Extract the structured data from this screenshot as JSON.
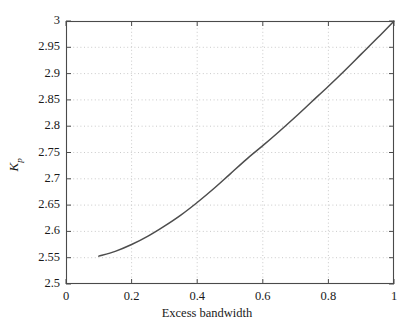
{
  "chart_data": {
    "type": "line",
    "title": "",
    "xlabel": "Excess bandwidth",
    "ylabel": "K_p",
    "ylabel_base": "K",
    "ylabel_sub": "p",
    "xlim": [
      0,
      1
    ],
    "ylim": [
      2.5,
      3
    ],
    "xticks": [
      "0",
      "0.2",
      "0.4",
      "0.6",
      "0.8",
      "1"
    ],
    "xtick_values": [
      0,
      0.2,
      0.4,
      0.6,
      0.8,
      1
    ],
    "yticks": [
      "2.5",
      "2.55",
      "2.6",
      "2.65",
      "2.7",
      "2.75",
      "2.8",
      "2.85",
      "2.9",
      "2.95",
      "3"
    ],
    "ytick_values": [
      2.5,
      2.55,
      2.6,
      2.65,
      2.7,
      2.75,
      2.8,
      2.85,
      2.9,
      2.95,
      3.0
    ],
    "grid": true,
    "grid_style": "dotted",
    "legend": null,
    "series": [
      {
        "name": "Kp vs excess bandwidth",
        "color": "#4d4d4d",
        "x": [
          0.1,
          0.15,
          0.2,
          0.25,
          0.3,
          0.35,
          0.4,
          0.45,
          0.5,
          0.55,
          0.6,
          0.65,
          0.7,
          0.75,
          0.8,
          0.85,
          0.9,
          0.95,
          1.0
        ],
        "y": [
          2.553,
          2.562,
          2.575,
          2.591,
          2.61,
          2.631,
          2.655,
          2.681,
          2.709,
          2.737,
          2.763,
          2.79,
          2.818,
          2.847,
          2.876,
          2.906,
          2.937,
          2.968,
          3.0
        ]
      }
    ]
  },
  "colors": {
    "curve": "#4d4d4d",
    "axis": "#4a4a4a",
    "grid": "#bdbdbd",
    "text": "#1a1a1a",
    "background": "#ffffff"
  },
  "geometry": {
    "plot_left": 66,
    "plot_right": 394,
    "plot_top": 21,
    "plot_bottom": 284
  }
}
